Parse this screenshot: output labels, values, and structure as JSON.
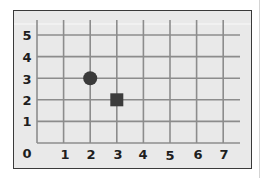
{
  "diagram": {
    "type": "coordinate-grid",
    "x_axis": {
      "min": 0,
      "max": 7,
      "ticks": [
        "0",
        "1",
        "2",
        "3",
        "4",
        "5",
        "6",
        "7"
      ]
    },
    "y_axis": {
      "min": 0,
      "max": 5,
      "ticks": [
        "0",
        "1",
        "2",
        "3",
        "4",
        "5"
      ]
    },
    "origin_label": "0",
    "x_labels": [
      "1",
      "2",
      "3",
      "4",
      "5",
      "6",
      "7"
    ],
    "y_labels": [
      "1",
      "2",
      "3",
      "4",
      "5"
    ],
    "points": [
      {
        "shape": "circle",
        "x": 2,
        "y": 3,
        "color": "#3a3a3a"
      },
      {
        "shape": "square",
        "x": 3,
        "y": 2,
        "color": "#3c3c3c"
      }
    ],
    "colors": {
      "frame_border": "#3a3a3a",
      "background": "#e9e9e9",
      "grid_line": "#8c8c8c",
      "label": "#1e1e1e"
    }
  }
}
